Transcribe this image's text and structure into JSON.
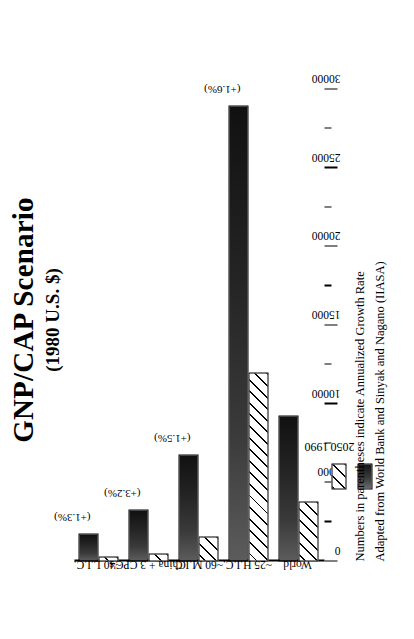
{
  "chart_data": {
    "type": "bar",
    "title": "GNP/CAP Scenario",
    "subtitle": "(1980 U.S. $)",
    "orientation": "vertical-grouped",
    "xlabel": "",
    "ylabel": "",
    "ylim": [
      0,
      30000
    ],
    "grid": false,
    "legend_position": "left-below-axis",
    "categories": [
      "~40 L.I.C.",
      "China + 3 CPC's",
      "~60 M.I.C.",
      "~25 H.I.C.",
      "World"
    ],
    "series": [
      {
        "name": "1990",
        "values": [
          300,
          500,
          1600,
          12000,
          3800
        ]
      },
      {
        "name": "2050",
        "values": [
          1800,
          3300,
          6800,
          29000,
          9300
        ]
      }
    ],
    "annotations": [
      "(+1.3%)",
      "(+3.2%)",
      "(+1.5%)",
      "(+1.6%)",
      ""
    ],
    "tick_labels": [
      "30000",
      "25000",
      "20000",
      "15000",
      "10000",
      "5000",
      "0"
    ],
    "tick_values": [
      30000,
      25000,
      20000,
      15000,
      10000,
      5000,
      0
    ],
    "minor_tick_values": [
      27500,
      22500,
      17500,
      12500,
      7500,
      2500
    ],
    "notes": [
      "Numbers in parentheses indicate Annualized Growth Rate",
      "Adapted from World Bank and Sinyak and Nagano (IIASA)"
    ],
    "colors": {
      "series_1990": "#ffffff",
      "series_2050": "#242424",
      "axis": "#000000",
      "background": "#ffffff"
    }
  },
  "legend": {
    "items": [
      {
        "label": "1990",
        "style": "hatched"
      },
      {
        "label": "2050",
        "style": "dark-gradient"
      }
    ]
  }
}
